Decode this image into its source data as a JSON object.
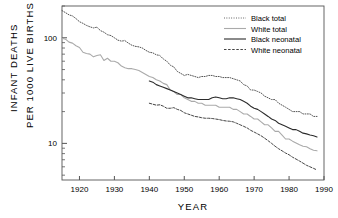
{
  "chart_data": {
    "type": "line",
    "title": "",
    "xlabel": "YEAR",
    "ylabel_line1": "INFANT DEATHS",
    "ylabel_line2": "PER 1000 LIVE BIRTHS",
    "yscale": "log",
    "xlim": [
      1915,
      1990
    ],
    "ylim": [
      4.5,
      200
    ],
    "grid": false,
    "legend_position": "top-right",
    "xticks": [
      1920,
      1930,
      1940,
      1950,
      1960,
      1970,
      1980,
      1990
    ],
    "xtick_labels": [
      "1920",
      "1930",
      "1940",
      "1950",
      "1960",
      "1970",
      "1980",
      "1990"
    ],
    "yticks": [
      10,
      100
    ],
    "ytick_labels": [
      "10",
      "100"
    ],
    "yminor_ticks": [
      5,
      6,
      7,
      8,
      9,
      20,
      30,
      40,
      50,
      60,
      70,
      80,
      90,
      200
    ],
    "series": [
      {
        "name": "Black total",
        "style": "dash-dot",
        "color": "#555555",
        "x": [
          1915,
          1916,
          1917,
          1918,
          1919,
          1920,
          1921,
          1922,
          1923,
          1924,
          1925,
          1926,
          1927,
          1928,
          1929,
          1930,
          1931,
          1932,
          1933,
          1934,
          1935,
          1936,
          1937,
          1938,
          1939,
          1940,
          1941,
          1942,
          1943,
          1944,
          1945,
          1946,
          1947,
          1948,
          1949,
          1950,
          1951,
          1952,
          1953,
          1954,
          1955,
          1956,
          1957,
          1958,
          1959,
          1960,
          1961,
          1962,
          1963,
          1964,
          1965,
          1966,
          1967,
          1968,
          1969,
          1970,
          1971,
          1972,
          1973,
          1974,
          1975,
          1976,
          1977,
          1978,
          1979,
          1980,
          1981,
          1982,
          1983,
          1984,
          1985,
          1986,
          1987,
          1988
        ],
        "values": [
          181,
          173,
          165,
          161,
          152,
          142,
          137,
          131,
          127,
          124,
          126,
          117,
          113,
          107,
          105,
          100,
          95,
          93,
          94,
          89,
          85,
          83,
          82,
          80,
          76,
          73,
          72,
          69,
          68,
          63,
          60,
          55,
          53,
          48,
          46,
          44,
          45,
          44,
          43,
          42,
          43,
          43,
          44,
          44,
          43,
          43,
          42,
          42,
          42,
          41,
          40,
          39,
          36,
          35,
          32,
          32,
          31,
          30,
          28,
          27,
          26,
          26,
          24,
          23,
          22,
          21,
          20,
          20,
          20,
          19,
          19,
          19,
          18,
          18
        ]
      },
      {
        "name": "White total",
        "style": "solid",
        "color": "#aaaaaa",
        "x": [
          1915,
          1916,
          1917,
          1918,
          1919,
          1920,
          1921,
          1922,
          1923,
          1924,
          1925,
          1926,
          1927,
          1928,
          1929,
          1930,
          1931,
          1932,
          1933,
          1934,
          1935,
          1936,
          1937,
          1938,
          1939,
          1940,
          1941,
          1942,
          1943,
          1944,
          1945,
          1946,
          1947,
          1948,
          1949,
          1950,
          1951,
          1952,
          1953,
          1954,
          1955,
          1956,
          1957,
          1958,
          1959,
          1960,
          1961,
          1962,
          1963,
          1964,
          1965,
          1966,
          1967,
          1968,
          1969,
          1970,
          1971,
          1972,
          1973,
          1974,
          1975,
          1976,
          1977,
          1978,
          1979,
          1980,
          1981,
          1982,
          1983,
          1984,
          1985,
          1986,
          1987,
          1988
        ],
        "values": [
          99,
          97,
          91,
          89,
          84,
          81,
          73,
          71,
          70,
          66,
          68,
          69,
          61,
          64,
          60,
          60,
          58,
          54,
          52,
          51,
          51,
          50,
          49,
          47,
          45,
          43,
          42,
          40,
          39,
          37,
          36,
          32,
          31,
          29,
          29,
          27,
          26,
          25,
          25,
          24,
          24,
          23,
          23,
          23,
          23,
          22,
          22,
          22,
          22,
          21,
          21,
          20,
          19,
          19,
          18,
          17,
          17,
          16,
          15,
          15,
          14,
          13,
          13,
          12,
          11,
          11,
          10.5,
          10.1,
          9.7,
          9.4,
          9.3,
          8.9,
          8.6,
          8.5
        ]
      },
      {
        "name": "Black neonatal",
        "style": "solid",
        "color": "#2b2b2b",
        "x": [
          1940,
          1941,
          1942,
          1943,
          1944,
          1945,
          1946,
          1947,
          1948,
          1949,
          1950,
          1951,
          1952,
          1953,
          1954,
          1955,
          1956,
          1957,
          1958,
          1959,
          1960,
          1961,
          1962,
          1963,
          1964,
          1965,
          1966,
          1967,
          1968,
          1969,
          1970,
          1971,
          1972,
          1973,
          1974,
          1975,
          1976,
          1977,
          1978,
          1979,
          1980,
          1981,
          1982,
          1983,
          1984,
          1985,
          1986,
          1987,
          1988
        ],
        "values": [
          39,
          38,
          36,
          35,
          34,
          33,
          32,
          31,
          30,
          29,
          28,
          27,
          27,
          26.5,
          26,
          26,
          26,
          26,
          27,
          27.5,
          27,
          26.5,
          26.5,
          27,
          27,
          26.5,
          26,
          25,
          24,
          22.5,
          21.5,
          21,
          20,
          19,
          18,
          17,
          16.5,
          15.5,
          15,
          14.5,
          14,
          13.5,
          13.5,
          13,
          12.5,
          12.3,
          12,
          11.8,
          11.5
        ]
      },
      {
        "name": "White neonatal",
        "style": "dashed",
        "color": "#444444",
        "x": [
          1940,
          1941,
          1942,
          1943,
          1944,
          1945,
          1946,
          1947,
          1948,
          1949,
          1950,
          1951,
          1952,
          1953,
          1954,
          1955,
          1956,
          1957,
          1958,
          1959,
          1960,
          1961,
          1962,
          1963,
          1964,
          1965,
          1966,
          1967,
          1968,
          1969,
          1970,
          1971,
          1972,
          1973,
          1974,
          1975,
          1976,
          1977,
          1978,
          1979,
          1980,
          1981,
          1982,
          1983,
          1984,
          1985,
          1986,
          1987,
          1988
        ],
        "values": [
          24,
          23.5,
          23,
          23.2,
          22.5,
          21.5,
          21.5,
          21.8,
          21,
          20.5,
          19.5,
          19,
          18.5,
          18,
          17.8,
          17.5,
          17.3,
          17.3,
          17.2,
          17,
          16.8,
          16.5,
          16.3,
          16.2,
          16,
          15.5,
          15,
          14.5,
          14,
          13.3,
          12.8,
          12.3,
          11.8,
          11.2,
          10.6,
          10,
          9.4,
          8.9,
          8.5,
          8.1,
          7.8,
          7.4,
          7.1,
          6.8,
          6.5,
          6.2,
          6,
          5.8,
          5.6
        ]
      }
    ]
  }
}
